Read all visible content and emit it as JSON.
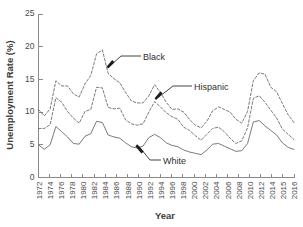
{
  "chart_data": {
    "type": "line",
    "title": "",
    "xlabel": "Year",
    "ylabel": "Unemployment Rate (%)",
    "xlim": [
      1972,
      2016
    ],
    "ylim": [
      0,
      25
    ],
    "yticks": [
      0,
      5,
      10,
      15,
      20,
      25
    ],
    "ytick_labels": [
      "0",
      "5",
      "10",
      "15",
      "20",
      "25"
    ],
    "xtick_labels": [
      "1972",
      "1974",
      "1976",
      "1978",
      "1980",
      "1982",
      "1984",
      "1986",
      "1988",
      "1990",
      "1992",
      "1994",
      "1996",
      "1998",
      "2000",
      "2002",
      "2004",
      "2006",
      "2008",
      "2010",
      "2012",
      "2014",
      "2015",
      "2016"
    ],
    "grid": false,
    "legend_position": "inline-annotations",
    "x": [
      1972,
      1973,
      1974,
      1975,
      1976,
      1977,
      1978,
      1979,
      1980,
      1981,
      1982,
      1983,
      1984,
      1985,
      1986,
      1987,
      1988,
      1989,
      1990,
      1991,
      1992,
      1993,
      1994,
      1995,
      1996,
      1997,
      1998,
      1999,
      2000,
      2001,
      2002,
      2003,
      2004,
      2005,
      2006,
      2007,
      2008,
      2009,
      2010,
      2011,
      2012,
      2013,
      2014,
      2015,
      2016
    ],
    "series": [
      {
        "name": "Black",
        "style": "dashed",
        "color": "#6b6b6b",
        "values": [
          10.4,
          9.4,
          10.5,
          14.8,
          14.0,
          14.0,
          12.8,
          12.3,
          14.3,
          15.6,
          18.9,
          19.5,
          15.9,
          15.1,
          14.5,
          13.0,
          11.7,
          11.4,
          11.4,
          12.5,
          14.2,
          13.0,
          11.5,
          10.4,
          10.5,
          10.0,
          8.9,
          8.0,
          7.6,
          8.6,
          10.2,
          10.8,
          10.4,
          10.0,
          8.9,
          8.3,
          10.1,
          14.8,
          16.0,
          15.8,
          13.8,
          13.1,
          11.3,
          9.6,
          8.4
        ]
      },
      {
        "name": "Hispanic",
        "style": "dashed",
        "color": "#6b6b6b",
        "values": [
          7.5,
          7.5,
          8.1,
          12.2,
          11.5,
          10.1,
          9.1,
          8.3,
          10.1,
          10.4,
          13.8,
          13.7,
          10.7,
          10.5,
          10.6,
          8.8,
          8.2,
          8.0,
          8.2,
          10.0,
          11.6,
          10.8,
          9.9,
          9.3,
          8.9,
          7.7,
          7.2,
          6.4,
          5.7,
          6.6,
          7.5,
          7.7,
          7.0,
          6.0,
          5.2,
          5.6,
          7.6,
          12.1,
          12.5,
          11.5,
          10.3,
          9.1,
          7.4,
          6.6,
          5.8
        ]
      },
      {
        "name": "White",
        "style": "solid",
        "color": "#6b6b6b",
        "values": [
          5.0,
          4.3,
          5.0,
          7.8,
          7.0,
          6.2,
          5.2,
          5.1,
          6.3,
          6.7,
          8.6,
          8.4,
          6.5,
          6.2,
          6.0,
          5.3,
          4.7,
          4.5,
          4.8,
          6.1,
          6.6,
          6.1,
          5.3,
          4.9,
          4.7,
          4.2,
          3.9,
          3.7,
          3.5,
          4.2,
          5.1,
          5.2,
          4.8,
          4.4,
          4.0,
          4.1,
          5.2,
          8.5,
          8.7,
          7.9,
          7.2,
          6.5,
          5.3,
          4.6,
          4.3
        ]
      }
    ],
    "annotations": [
      {
        "label": "Black",
        "target_year": 1984,
        "target_value": 15.9
      },
      {
        "label": "Hispanic",
        "target_year": 1992,
        "target_value": 11.6
      },
      {
        "label": "White",
        "target_year": 1990,
        "target_value": 4.8
      }
    ]
  }
}
